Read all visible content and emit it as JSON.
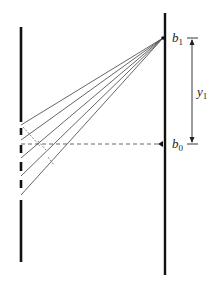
{
  "diagram": {
    "labels": {
      "b1": {
        "main": "b",
        "sub": "1"
      },
      "b0": {
        "main": "b",
        "sub": "0"
      },
      "y1": {
        "main": "y",
        "sub": "1"
      }
    },
    "elements": {
      "grating": "barrier with five slits (left)",
      "screen": "observation screen (right)",
      "rays": 5,
      "central_axis": "dashed line from grating to b0",
      "dimension": "y1 between b0 and b1"
    },
    "colors": {
      "barrier": "#111111",
      "rays": "#555555",
      "dashed": "#555555",
      "text": "#222222"
    }
  }
}
